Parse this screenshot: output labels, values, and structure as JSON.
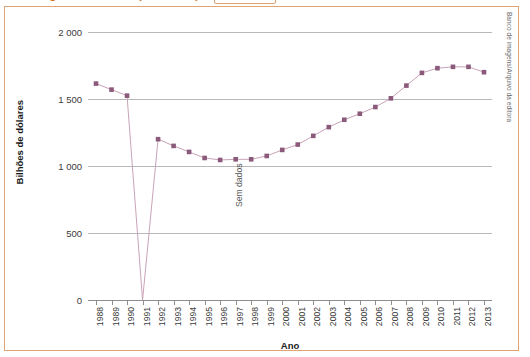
{
  "title": {
    "text": "Mundo: gastos militares (1988-2013)",
    "color": "#D4772A"
  },
  "credit": "Banco de imagens/Arquivo da editora",
  "annotation": {
    "no_data_label": "Sem dados",
    "no_data_year": "1991"
  },
  "chart_data": {
    "type": "line",
    "title": "Mundo: gastos militares (1988-2013)",
    "xlabel": "Ano",
    "ylabel": "Bilhões de dólares",
    "x": [
      "1988",
      "1989",
      "1990",
      "1991",
      "1992",
      "1993",
      "1994",
      "1995",
      "1996",
      "1997",
      "1998",
      "1999",
      "2000",
      "2001",
      "2002",
      "2003",
      "2004",
      "2005",
      "2006",
      "2007",
      "2008",
      "2009",
      "2010",
      "2011",
      "2012",
      "2013"
    ],
    "values": [
      1615,
      1570,
      1525,
      0,
      1200,
      1150,
      1105,
      1060,
      1045,
      1050,
      1050,
      1075,
      1120,
      1160,
      1225,
      1290,
      1345,
      1390,
      1440,
      1505,
      1600,
      1695,
      1730,
      1740,
      1740,
      1700
    ],
    "missing_x": [
      "1991"
    ],
    "ylim": [
      0,
      2000
    ],
    "yticks": [
      0,
      500,
      1000,
      1500,
      2000
    ],
    "ytick_labels": [
      "0",
      "500",
      "1 000",
      "1 500",
      "2 000"
    ],
    "grid": true,
    "legend": false,
    "marker": "square",
    "marker_color": "#8B5A7A",
    "line_color": "#C9A3B8"
  }
}
